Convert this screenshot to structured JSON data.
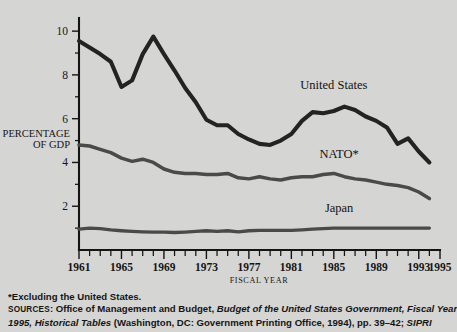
{
  "chart_data": {
    "type": "line",
    "title": "",
    "xlabel": "FISCAL YEAR",
    "ylabel": "PERCENTAGE OF GDP",
    "ylabel_line1": "PERCENTAGE",
    "ylabel_line2": "OF GDP",
    "xlim": [
      1961,
      1995
    ],
    "ylim": [
      0,
      10.6
    ],
    "yticks": [
      2,
      4,
      6,
      8,
      10
    ],
    "ytick_labels": [
      "2",
      "4",
      "6",
      "8",
      "10"
    ],
    "yminor_ticks": [
      1,
      3,
      5,
      7,
      9
    ],
    "xticks": [
      1961,
      1965,
      1969,
      1973,
      1977,
      1981,
      1985,
      1989,
      1993,
      1995
    ],
    "xtick_labels": [
      "1961",
      "1965",
      "1969",
      "1973",
      "1977",
      "1981",
      "1985",
      "1989",
      "1993",
      "1995"
    ],
    "x": [
      1961,
      1962,
      1963,
      1964,
      1965,
      1966,
      1967,
      1968,
      1969,
      1970,
      1971,
      1972,
      1973,
      1974,
      1975,
      1976,
      1977,
      1978,
      1979,
      1980,
      1981,
      1982,
      1983,
      1984,
      1985,
      1986,
      1987,
      1988,
      1989,
      1990,
      1991,
      1992,
      1993,
      1994
    ],
    "grid": false,
    "legend_position": "inline-labels",
    "series": [
      {
        "name": "United States",
        "label": "United States",
        "color": "#232323",
        "label_x": 1985.0,
        "label_y": 7.35,
        "values": [
          9.55,
          9.25,
          8.95,
          8.6,
          7.45,
          7.75,
          8.95,
          9.75,
          8.95,
          8.2,
          7.4,
          6.75,
          5.95,
          5.7,
          5.7,
          5.3,
          5.05,
          4.85,
          4.8,
          5.0,
          5.3,
          5.9,
          6.3,
          6.25,
          6.35,
          6.55,
          6.4,
          6.1,
          5.9,
          5.6,
          4.85,
          5.1,
          4.5,
          4.0
        ]
      },
      {
        "name": "NATO*",
        "label": "NATO*",
        "color": "#4a4a4a",
        "label_x": 1985.5,
        "label_y": 4.2,
        "values": [
          4.8,
          4.75,
          4.6,
          4.45,
          4.2,
          4.05,
          4.15,
          4.0,
          3.7,
          3.55,
          3.5,
          3.5,
          3.45,
          3.45,
          3.5,
          3.3,
          3.25,
          3.35,
          3.25,
          3.2,
          3.3,
          3.35,
          3.35,
          3.45,
          3.5,
          3.35,
          3.25,
          3.2,
          3.1,
          3.0,
          2.95,
          2.85,
          2.65,
          2.35
        ]
      },
      {
        "name": "Japan",
        "label": "Japan",
        "color": "#4a4a4a",
        "label_x": 1985.5,
        "label_y": 1.75,
        "values": [
          0.95,
          1.0,
          0.98,
          0.92,
          0.88,
          0.85,
          0.83,
          0.82,
          0.82,
          0.8,
          0.82,
          0.85,
          0.88,
          0.85,
          0.88,
          0.83,
          0.88,
          0.9,
          0.9,
          0.9,
          0.9,
          0.92,
          0.95,
          0.98,
          1.0,
          1.0,
          1.0,
          1.0,
          1.0,
          1.0,
          1.0,
          1.0,
          1.0,
          1.0
        ]
      }
    ]
  },
  "footnotes": {
    "asterisk_note": "*Excluding the United States.",
    "sources_label": "SOURCES",
    "sources_line1_a": ": Office of Management and Budget, ",
    "sources_line1_italic": "Budget of the United States Government, Fiscal Year",
    "sources_line2_italic_a": "1995, Historical Tables",
    "sources_line2_b": " (Washington, DC: Government Printing Office, 1994), pp. 39–42; ",
    "sources_line2_italic_b": "SIPRI"
  }
}
